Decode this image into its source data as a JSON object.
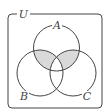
{
  "diagram": {
    "type": "venn",
    "universe_label": "U",
    "sets": [
      {
        "name": "A",
        "label": "A",
        "cx": 56.5,
        "cy": 48,
        "r": 23
      },
      {
        "name": "B",
        "label": "B",
        "cx": 40,
        "cy": 73,
        "r": 23
      },
      {
        "name": "C",
        "label": "C",
        "cx": 73,
        "cy": 73,
        "r": 23
      }
    ],
    "shaded_regions": [
      "A∩B∖C",
      "A∩C∖B"
    ],
    "colors": {
      "stroke": "#444444",
      "shade": "#d9d9d9",
      "background": "#ffffff"
    }
  }
}
